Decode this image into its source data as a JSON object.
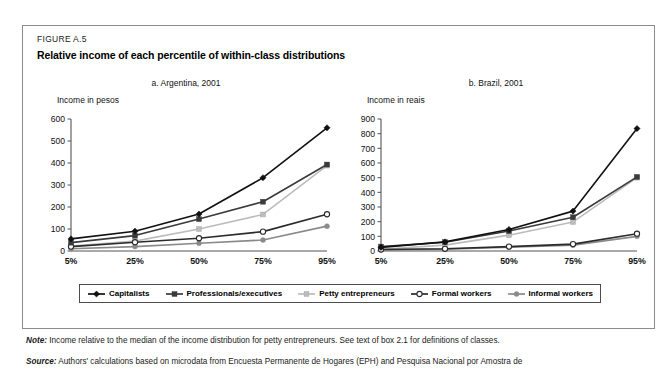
{
  "figure": {
    "label": "FIGURE A.5",
    "title": "Relative income of each percentile of within-class distributions"
  },
  "notes": {
    "note_prefix": "Note:",
    "note_text": "Income relative to the median of the income distribution for petty entrepreneurs. See text of box 2.1 for definitions of classes.",
    "source_prefix": "Source:",
    "source_text": "Authors' calculations based on microdata from Encuesta Permanente de Hogares (EPH) and Pesquisa Nacional por Amostra de"
  },
  "legend": {
    "items": [
      {
        "label": "Capitalists",
        "marker": "filled-diamond-marker",
        "color": "#111111"
      },
      {
        "label": "Professionals/executives",
        "marker": "filled-square-marker",
        "color": "#3a3a3a"
      },
      {
        "label": "Petty entrepreneurs",
        "marker": "light-square-marker",
        "color": "#bcbcbc"
      },
      {
        "label": "Formal workers",
        "marker": "open-circle-marker",
        "color": "#2b2b2b"
      },
      {
        "label": "Informal workers",
        "marker": "filled-circle-marker",
        "color": "#8a8a8a"
      }
    ]
  },
  "chart_data": [
    {
      "type": "line",
      "panel_id": "a",
      "title": "a. Argentina, 2001",
      "ylabel": "Income in pesos",
      "xlabel": "",
      "categories": [
        "5%",
        "25%",
        "50%",
        "75%",
        "95%"
      ],
      "ylim": [
        0,
        600
      ],
      "yticks": [
        0,
        100,
        200,
        300,
        400,
        500,
        600
      ],
      "grid": false,
      "legend_position": "bottom",
      "series": [
        {
          "name": "Capitalists",
          "values": [
            55,
            90,
            168,
            333,
            560
          ],
          "color": "#111111"
        },
        {
          "name": "Professionals/executives",
          "values": [
            38,
            70,
            145,
            224,
            393
          ],
          "color": "#3a3a3a"
        },
        {
          "name": "Petty entrepreneurs",
          "values": [
            22,
            45,
            100,
            166,
            388
          ],
          "color": "#bcbcbc"
        },
        {
          "name": "Formal workers",
          "values": [
            20,
            40,
            58,
            88,
            167
          ],
          "color": "#2b2b2b"
        },
        {
          "name": "Informal workers",
          "values": [
            10,
            20,
            35,
            50,
            113
          ],
          "color": "#8a8a8a"
        }
      ]
    },
    {
      "type": "line",
      "panel_id": "b",
      "title": "b. Brazil, 2001",
      "ylabel": "Income in reais",
      "xlabel": "",
      "categories": [
        "5%",
        "25%",
        "50%",
        "75%",
        "95%"
      ],
      "ylim": [
        0,
        900
      ],
      "yticks": [
        0,
        100,
        200,
        300,
        400,
        500,
        600,
        700,
        800,
        900
      ],
      "grid": false,
      "legend_position": "bottom",
      "series": [
        {
          "name": "Capitalists",
          "values": [
            25,
            62,
            146,
            272,
            835
          ],
          "color": "#111111"
        },
        {
          "name": "Professionals/executives",
          "values": [
            30,
            60,
            136,
            230,
            505
          ],
          "color": "#3a3a3a"
        },
        {
          "name": "Petty entrepreneurs",
          "values": [
            12,
            40,
            108,
            198,
            500
          ],
          "color": "#bcbcbc"
        },
        {
          "name": "Formal workers",
          "values": [
            10,
            15,
            30,
            47,
            118
          ],
          "color": "#2b2b2b"
        },
        {
          "name": "Informal workers",
          "values": [
            8,
            12,
            26,
            40,
            100
          ],
          "color": "#8a8a8a"
        }
      ]
    }
  ]
}
